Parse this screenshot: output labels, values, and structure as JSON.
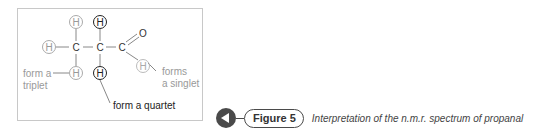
{
  "diagram": {
    "atoms": {
      "h_top_left": "H",
      "h_top_mid": "H",
      "h_left": "H",
      "c1": "C",
      "c2": "C",
      "c3": "C",
      "o": "O",
      "h_bottom_left": "H",
      "h_bottom_mid": "H",
      "h_aldehyde": "H"
    },
    "labels": {
      "triplet_line1": "form a",
      "triplet_line2": "triplet",
      "singlet_line1": "forms",
      "singlet_line2": "a singlet",
      "quartet": "form a quartet"
    },
    "colors": {
      "highlight": "#222222",
      "muted": "#a0a0a0"
    }
  },
  "caption": {
    "figure_label": "Figure 5",
    "description": "Interpretation of the n.m.r. spectrum of propanal"
  }
}
